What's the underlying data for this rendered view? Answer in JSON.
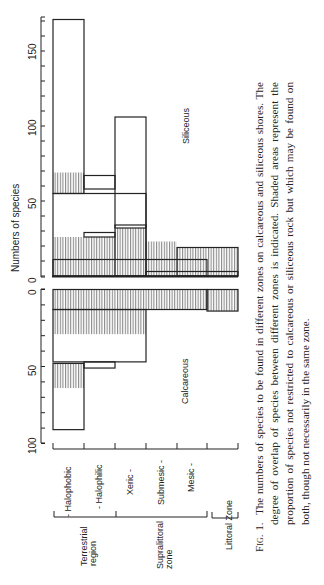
{
  "caption": {
    "label": "Fig. 1.",
    "text": "The numbers of species to be found in different zones on calcareous and siliceous shores. The degree of overlap of species between different zones is indicated. Shaded areas represent the proportion of species not restricted to calcareous or siliceous rock but which may be found on both, though not necessarily in the same zone."
  },
  "axes": {
    "ylabel": "Numbers of species",
    "siliceous_label": "Siliceous",
    "calcareous_label": "Calcareous",
    "siliceous_ticks": [
      "0",
      "50",
      "100",
      "150"
    ],
    "calcareous_ticks": [
      "0",
      "50",
      "100"
    ]
  },
  "zones": {
    "items": [
      "- Halophobic",
      "- Halophilic",
      "Xeric -",
      "Submesic -",
      "Mesic -"
    ],
    "groups": [
      "Terrestrial region",
      "Supralittoral zone",
      "Littoral Zone"
    ],
    "group_lines": [
      [
        "Terrestrial",
        "region"
      ],
      [
        "Supralittoral",
        "zone"
      ]
    ]
  },
  "chart_data": {
    "type": "bar",
    "xlabel": "Zone",
    "ylabel": "Numbers of species",
    "orientation": "figure rotated 90° counter-clockwise; siliceous panel above, calcareous panel below (mirrored)",
    "categories": [
      "Halophobic",
      "Halophilic",
      "Xeric",
      "Submesic",
      "Mesic",
      "Littoral Zone"
    ],
    "category_groups": [
      {
        "name": "Terrestrial region",
        "categories": [
          "Halophobic",
          "Halophilic"
        ]
      },
      {
        "name": "Supralittoral zone",
        "categories": [
          "Xeric",
          "Submesic",
          "Mesic"
        ]
      },
      {
        "name": "Littoral Zone",
        "categories": [
          "Littoral Zone"
        ]
      }
    ],
    "legend": {
      "shaded": "species found on both calcareous and siliceous rock"
    },
    "grid": false,
    "panels": [
      {
        "name": "Siliceous",
        "ylim": [
          0,
          175
        ],
        "ticks": [
          0,
          50,
          100,
          150
        ],
        "blocks": [
          {
            "from_cat": 0,
            "to_cat": 4,
            "y0": 0,
            "y1": 11,
            "shaded": true
          },
          {
            "from_cat": 0,
            "to_cat": 2,
            "y0": 11,
            "y1": 26,
            "shaded": true
          },
          {
            "from_cat": 1,
            "to_cat": 1,
            "y0": 26,
            "y1": 29,
            "shaded": false
          },
          {
            "from_cat": 2,
            "to_cat": 2,
            "y0": 11,
            "y1": 32,
            "shaded": true
          },
          {
            "from_cat": 2,
            "to_cat": 2,
            "y0": 32,
            "y1": 34,
            "shaded": false
          },
          {
            "from_cat": 0,
            "to_cat": 2,
            "y0": 0,
            "y1": 55,
            "shaded": false
          },
          {
            "from_cat": 2,
            "to_cat": 2,
            "y0": 0,
            "y1": 106,
            "shaded": false
          },
          {
            "from_cat": 0,
            "to_cat": 0,
            "y0": 55,
            "y1": 69,
            "shaded": true
          },
          {
            "from_cat": 0,
            "to_cat": 0,
            "y0": 55,
            "y1": 171,
            "shaded": false
          },
          {
            "from_cat": 1,
            "to_cat": 1,
            "y0": 58,
            "y1": 67,
            "shaded": false
          },
          {
            "from_cat": 3,
            "to_cat": 3,
            "y0": 3,
            "y1": 23,
            "shaded": true
          },
          {
            "from_cat": 4,
            "to_cat": 5,
            "y0": 0,
            "y1": 19,
            "shaded": true
          },
          {
            "from_cat": 3,
            "to_cat": 5,
            "y0": 0,
            "y1": 3,
            "shaded": false
          }
        ],
        "approx_totals": {
          "Halophobic": 171,
          "Halophilic": 67,
          "Xeric": 106,
          "Submesic": 34,
          "Mesic": 23,
          "Littoral Zone": 19
        }
      },
      {
        "name": "Calcareous",
        "ylim": [
          0,
          100
        ],
        "ticks": [
          0,
          50,
          100
        ],
        "blocks": [
          {
            "from_cat": 0,
            "to_cat": 4,
            "y0": 0,
            "y1": 13,
            "shaded": true
          },
          {
            "from_cat": 5,
            "to_cat": 5,
            "y0": 0,
            "y1": 14,
            "shaded": true
          },
          {
            "from_cat": 0,
            "to_cat": 2,
            "y0": 13,
            "y1": 29,
            "shaded": true
          },
          {
            "from_cat": 0,
            "to_cat": 2,
            "y0": 13,
            "y1": 47,
            "shaded": false
          },
          {
            "from_cat": 1,
            "to_cat": 1,
            "y0": 47,
            "y1": 51,
            "shaded": false
          },
          {
            "from_cat": 0,
            "to_cat": 0,
            "y0": 48,
            "y1": 64,
            "shaded": true
          },
          {
            "from_cat": 0,
            "to_cat": 0,
            "y0": 48,
            "y1": 91,
            "shaded": false
          }
        ],
        "approx_totals": {
          "Halophobic": 91,
          "Halophilic": 51,
          "Xeric": 47,
          "Submesic": 13,
          "Mesic": 13,
          "Littoral Zone": 14
        }
      }
    ]
  }
}
